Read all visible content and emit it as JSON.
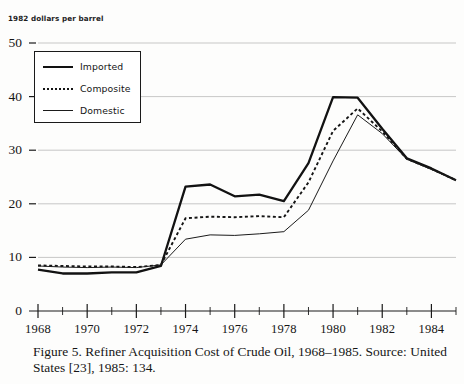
{
  "axis_title": "1982 dollars per barrel",
  "caption": "Figure 5.  Refiner Acquisition Cost of Crude Oil, 1968–1985. Source: United States [23], 1985: 134.",
  "legend": {
    "items": [
      {
        "label": "Imported",
        "style": "solid-thick",
        "color": "#121212"
      },
      {
        "label": "Composite",
        "style": "dotted",
        "color": "#151515"
      },
      {
        "label": "Domestic",
        "style": "solid-thin",
        "color": "#1b1b1b"
      }
    ]
  },
  "chart_data": {
    "type": "line",
    "title": "Refiner Acquisition Cost of Crude Oil, 1968–1985",
    "xlabel": "",
    "ylabel": "1982 dollars per barrel",
    "x": [
      1968,
      1969,
      1970,
      1971,
      1972,
      1973,
      1974,
      1975,
      1976,
      1977,
      1978,
      1979,
      1980,
      1981,
      1982,
      1983,
      1984,
      1985
    ],
    "xlim": [
      1968,
      1985
    ],
    "ylim": [
      0,
      50
    ],
    "xticks": [
      1968,
      1970,
      1972,
      1974,
      1976,
      1978,
      1980,
      1982,
      1984
    ],
    "xtick_labels": [
      "1968",
      "1970",
      "1972",
      "1974",
      "1976",
      "1978",
      "1980",
      "1982",
      "1984"
    ],
    "xminorticks": [
      1969,
      1971,
      1973,
      1975,
      1977,
      1979,
      1981,
      1983,
      1985
    ],
    "yticks": [
      0,
      10,
      20,
      30,
      40,
      50
    ],
    "ytick_labels": [
      "0",
      "10",
      "20",
      "30",
      "40",
      "50"
    ],
    "grid": "horizontal",
    "legend_position": "upper-left",
    "series": [
      {
        "name": "Imported",
        "values": [
          7.7,
          7.0,
          7.0,
          7.2,
          7.2,
          8.4,
          23.2,
          23.6,
          21.4,
          21.7,
          20.5,
          27.6,
          39.9,
          39.8,
          34.0,
          28.5,
          26.6,
          24.4
        ]
      },
      {
        "name": "Composite",
        "values": [
          8.5,
          8.4,
          8.3,
          8.3,
          8.2,
          8.6,
          17.3,
          17.6,
          17.5,
          17.7,
          17.5,
          24.0,
          33.6,
          37.8,
          33.5,
          28.4,
          26.5,
          24.4
        ]
      },
      {
        "name": "Domestic",
        "values": [
          8.4,
          8.2,
          8.1,
          8.2,
          8.1,
          8.6,
          13.4,
          14.2,
          14.1,
          14.4,
          14.8,
          18.8,
          28.0,
          36.6,
          33.1,
          28.3,
          26.4,
          24.4
        ]
      }
    ]
  }
}
